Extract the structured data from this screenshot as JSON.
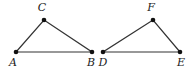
{
  "figure": {
    "triangles": [
      {
        "name": "ABC",
        "vertices": [
          {
            "label": "A",
            "x": 16,
            "y": 52,
            "lx": 13,
            "ly": 66
          },
          {
            "label": "B",
            "x": 92,
            "y": 52,
            "lx": 91,
            "ly": 66
          },
          {
            "label": "C",
            "x": 44,
            "y": 20,
            "lx": 42,
            "ly": 11
          }
        ]
      },
      {
        "name": "DEF",
        "vertices": [
          {
            "label": "D",
            "x": 103,
            "y": 52,
            "lx": 103,
            "ly": 66
          },
          {
            "label": "E",
            "x": 180,
            "y": 52,
            "lx": 181,
            "ly": 66
          },
          {
            "label": "F",
            "x": 153,
            "y": 20,
            "lx": 151,
            "ly": 11
          }
        ]
      }
    ],
    "colors": {
      "stroke": "#333333",
      "point": "#111111",
      "label": "#222222"
    }
  }
}
